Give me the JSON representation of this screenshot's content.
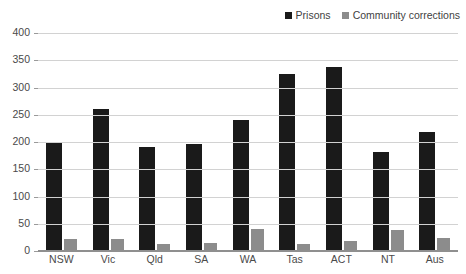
{
  "title_fragment": "Offenders in Corrective Services",
  "legend": {
    "position": "top-right",
    "items": [
      {
        "label": "Prisons",
        "color": "#1a1a1a",
        "key": "prisons"
      },
      {
        "label": "Community corrections",
        "color": "#8c8c8c",
        "key": "community"
      }
    ]
  },
  "chart_data": {
    "type": "bar",
    "title": "",
    "xlabel": "",
    "ylabel": "",
    "ylim": [
      0,
      400
    ],
    "yticks": [
      0,
      50,
      100,
      150,
      200,
      250,
      300,
      350,
      400
    ],
    "ytick_labels": [
      "0",
      "50",
      "100",
      "150",
      "200",
      "250",
      "300",
      "350",
      "400"
    ],
    "grid": true,
    "grid_axis": "y",
    "legend_position": "top-right",
    "categories": [
      "NSW",
      "Vic",
      "Qld",
      "SA",
      "WA",
      "Tas",
      "ACT",
      "NT",
      "Aus"
    ],
    "series": [
      {
        "name": "Prisons",
        "color": "#1a1a1a",
        "values": [
          198,
          260,
          190,
          196,
          240,
          325,
          338,
          182,
          218
        ]
      },
      {
        "name": "Community corrections",
        "color": "#8c8c8c",
        "values": [
          22,
          22,
          12,
          14,
          40,
          12,
          18,
          38,
          23
        ]
      }
    ]
  },
  "colors": {
    "prisons": "#1a1a1a",
    "community": "#8c8c8c",
    "gridline": "#d2d2d2",
    "axis": "#8f8f8f",
    "text": "#4a4a4a",
    "background": "#ffffff"
  }
}
